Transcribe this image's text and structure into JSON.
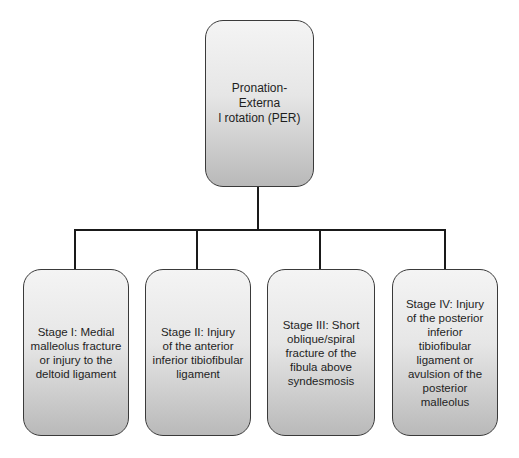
{
  "diagram": {
    "type": "tree",
    "root": {
      "label": "Pronation-Externa\nl rotation (PER)"
    },
    "children": [
      {
        "label": "Stage I: Medial\nmalleolus fracture\nor injury to the\ndeltoid ligament"
      },
      {
        "label": "Stage II: Injury\nof the anterior\ninferior tibiofibular\nligament"
      },
      {
        "label": "Stage III: Short\noblique/spiral\nfracture of the\nfibula above\nsyndesmosis"
      },
      {
        "label": "Stage IV: Injury\nof the posterior\ninferior\ntibiofibular\nligament or\navulsion of the\nposterior\nmalleolus"
      }
    ],
    "colors": {
      "node_border": "#3a3a3a",
      "node_fill_top": "#f4f4f4",
      "node_fill_bottom": "#b9b9b9",
      "connector": "#1a1a1a",
      "text": "#1e1e1e"
    }
  }
}
